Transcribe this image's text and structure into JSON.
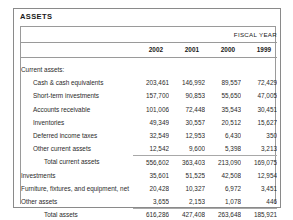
{
  "document": {
    "section_caption": "ASSETS",
    "fiscal_year_label": "FISCAL YEAR"
  },
  "table": {
    "label_header": "",
    "year_columns": [
      "2002",
      "2001",
      "2000",
      "1999"
    ],
    "rows": [
      {
        "label": "Current assets:",
        "indent": 0,
        "style": "header",
        "values": [
          "",
          "",
          "",
          ""
        ]
      },
      {
        "label": "Cash & cash equivalents",
        "indent": 1,
        "style": "normal",
        "values": [
          "203,461",
          "146,992",
          "89,557",
          "72,429"
        ]
      },
      {
        "label": "Short-term investments",
        "indent": 1,
        "style": "normal",
        "values": [
          "157,700",
          "90,853",
          "55,650",
          "47,005"
        ]
      },
      {
        "label": "Accounts receivable",
        "indent": 1,
        "style": "normal",
        "values": [
          "101,006",
          "72,448",
          "35,543",
          "30,451"
        ]
      },
      {
        "label": "Inventories",
        "indent": 1,
        "style": "normal",
        "values": [
          "49,349",
          "30,557",
          "20,512",
          "15,627"
        ]
      },
      {
        "label": "Deferred income taxes",
        "indent": 1,
        "style": "normal",
        "values": [
          "32,549",
          "12,953",
          "6,430",
          "350"
        ]
      },
      {
        "label": "Other current assets",
        "indent": 1,
        "style": "normal",
        "values": [
          "12,542",
          "9,600",
          "5,398",
          "3,213"
        ]
      },
      {
        "label": "Total current assets",
        "indent": 2,
        "style": "subtotal",
        "values": [
          "556,602",
          "363,403",
          "213,090",
          "169,075"
        ]
      },
      {
        "label": "Investments",
        "indent": 0,
        "style": "normal",
        "values": [
          "35,601",
          "51,525",
          "42,508",
          "12,954"
        ]
      },
      {
        "label": "Furniture, fixtures, and equipment, net",
        "indent": 0,
        "style": "normal",
        "values": [
          "20,428",
          "10,327",
          "6,972",
          "3,451"
        ]
      },
      {
        "label": "Other assets",
        "indent": 0,
        "style": "normal",
        "values": [
          "3,655",
          "2,153",
          "1,078",
          "446"
        ]
      },
      {
        "label": "Total assets",
        "indent": 2,
        "style": "grand",
        "values": [
          "616,286",
          "427,408",
          "263,648",
          "185,921"
        ]
      }
    ]
  },
  "colors": {
    "page_background": "#ffffff",
    "frame_border": "#8a8a8a",
    "rule": "#9a9a9a",
    "text": "#2b2b2b",
    "heading_text": "#1a1a1a"
  }
}
